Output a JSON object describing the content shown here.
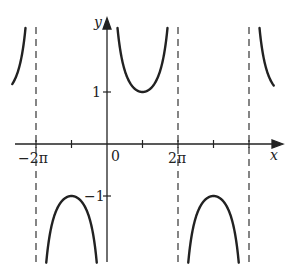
{
  "chart_data": {
    "type": "line",
    "title": "",
    "function": "y = csc(x/2)",
    "xlabel": "x",
    "ylabel": "y",
    "x_ticks": [
      {
        "value": "-2π",
        "label": "−2π"
      },
      {
        "value": "-π",
        "label": ""
      },
      {
        "value": "0",
        "label": "0"
      },
      {
        "value": "π",
        "label": ""
      },
      {
        "value": "2π",
        "label": "2π"
      },
      {
        "value": "3π",
        "label": ""
      },
      {
        "value": "4π",
        "label": ""
      }
    ],
    "y_ticks": [
      {
        "value": 1,
        "label": "1"
      },
      {
        "value": -1,
        "label": "−1"
      }
    ],
    "asymptotes": [
      "-2π",
      "0",
      "2π",
      "4π"
    ],
    "asymptote_style": "dashed",
    "xlim": [
      "-2.6π",
      "4.7π"
    ],
    "ylim": [
      -2.3,
      2.3
    ],
    "grid": false,
    "legend": null,
    "key_points": [
      {
        "x": "-π",
        "y": -1,
        "type": "local max"
      },
      {
        "x": "π",
        "y": 1,
        "type": "local min"
      },
      {
        "x": "3π",
        "y": -1,
        "type": "local max"
      }
    ],
    "branches": [
      {
        "x_range": [
          "-2.6π",
          "-2π"
        ],
        "shape": "rising to +∞"
      },
      {
        "x_range": [
          "-2π",
          "0"
        ],
        "shape": "downward cap, max -1 at -π"
      },
      {
        "x_range": [
          "0",
          "2π"
        ],
        "shape": "upward U, min 1 at π"
      },
      {
        "x_range": [
          "2π",
          "4π"
        ],
        "shape": "downward cap, max -1 at 3π"
      },
      {
        "x_range": [
          "4π",
          "4.7π"
        ],
        "shape": "falling from +∞"
      }
    ]
  },
  "labels": {
    "x_axis": "x",
    "y_axis": "y",
    "origin": "0",
    "neg_two_pi": "−2π",
    "two_pi": "2π",
    "y_one": "1",
    "y_neg_one": "−1"
  },
  "layout": {
    "origin_px": [
      107,
      144
    ],
    "px_per_pi": 35.5,
    "px_per_unit": 52,
    "clip_top": 27,
    "clip_bottom": 263,
    "x_left": 12,
    "x_right": 274,
    "curve_color": "#222222",
    "axis_color": "#222222",
    "dash_color": "#444444"
  }
}
